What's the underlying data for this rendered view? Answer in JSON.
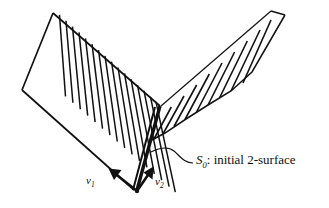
{
  "figure": {
    "background_color": "#ffffff",
    "ink_color": "#111111",
    "width": 329,
    "height": 208,
    "labels": {
      "v1": {
        "symbol": "v",
        "subscript": "1",
        "text": "v1",
        "role": "first null normal vector label"
      },
      "v2": {
        "symbol": "v",
        "subscript": "2",
        "text": "v2",
        "role": "second null normal vector label"
      },
      "surface": {
        "symbol": "S",
        "subscript": "0",
        "separator": ":",
        "description": "initial 2-surface",
        "text": "S0: initial 2-surface",
        "role": "callout label for the fold edge"
      }
    },
    "elements": {
      "left_panel": "hatched parallelogram sheet, left wing",
      "right_panel": "hatched sheet seen near edge-on, right wing",
      "fold_edge": "thick vertical crease where the two sheets meet",
      "leader_line": "curved pointer from caption to fold edge",
      "arrow_v1": "arrow pointing up-left from the bottom vertex",
      "arrow_v2": "arrow pointing up-right from the bottom vertex"
    }
  },
  "geometry": {
    "left_panel_outline": "53,13 22,90 134,190 160,106",
    "right_panel_outline": "160,106 270,10 286,14 176,118",
    "fold_edge": "from 160,106 to 136,190",
    "left_hatch_count": 17,
    "right_hatch_count": 9,
    "arrow_origin": "136,191",
    "arrow_v1_tip": "110,170",
    "arrow_v2_tip": "152,168"
  }
}
